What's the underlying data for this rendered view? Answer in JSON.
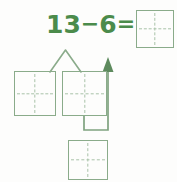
{
  "page": {
    "background_color": "#fdfdfc"
  },
  "colors": {
    "text_green": "#4b8b4b",
    "box_border_green": "#8aab8a",
    "dashed_line_green": "#a9c2a9",
    "connector_green": "#6f9a6f",
    "arrow_green": "#5d8a5d"
  },
  "equation": {
    "minuend": "13",
    "operator": "−",
    "subtrahend": "6",
    "equals": "=",
    "full_text": "13−6=",
    "answer_value": ""
  },
  "boxes": {
    "answer": {
      "name": "answer-box",
      "value": "",
      "x": 136,
      "y": 10,
      "w": 38,
      "h": 38
    },
    "tens": {
      "name": "tens-box",
      "value": "",
      "x": 14,
      "y": 71,
      "w": 42,
      "h": 45
    },
    "ones": {
      "name": "ones-box",
      "value": "",
      "x": 62,
      "y": 71,
      "w": 45,
      "h": 45
    },
    "result": {
      "name": "result-box",
      "value": "",
      "x": 68,
      "y": 140,
      "w": 40,
      "h": 40
    }
  },
  "connectors": {
    "branch": {
      "name": "decomposition-branch",
      "description": "inverted-V splitting 13 into tens and ones boxes"
    },
    "arrow": {
      "name": "regroup-arrow",
      "description": "arrow from result box up toward the ones column",
      "direction": "up"
    }
  },
  "icons": {
    "arrow_up": "arrow-up-icon",
    "branch": "branch-icon"
  }
}
